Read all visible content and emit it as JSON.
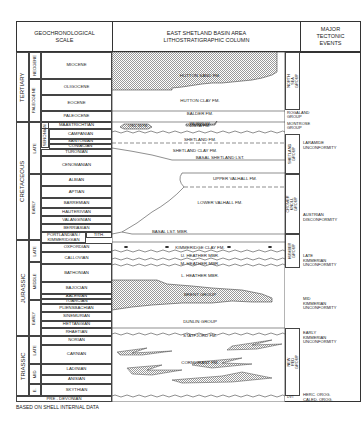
{
  "header": {
    "left": "GEOCHRONOLOGICAL\nSCALE",
    "center": "EAST SHETLAND BASIN AREA\nLITHOSTRATIGRAPHIC COLUMN",
    "right": "MAJOR\nTECTONIC\nEVENTS"
  },
  "eras": [
    {
      "name": "TERTIARY",
      "subs": [
        "NEOGENE",
        "PALEOGENE"
      ]
    },
    {
      "name": "CRETACEOUS",
      "subs": [
        "LATE",
        "EARLY",
        "SENONIAN"
      ]
    },
    {
      "name": "JURASSIC",
      "subs": [
        "LATE",
        "MIDDLE",
        "EARLY"
      ]
    },
    {
      "name": "TRIASSIC",
      "subs": [
        "LATE",
        "MID",
        "E."
      ]
    }
  ],
  "stages": [
    "MIOCENE",
    "OLIGOCENE",
    "EOCENE",
    "PALEOCENE",
    "MAASTRICHTIAN",
    "CAMPANIAN",
    "SANTONIAN",
    "CONIACIAN",
    "TURONIAN",
    "CENOMANIAN",
    "ALBIAN",
    "APTIAN",
    "BARREMIAN",
    "HAUTERIVIAN",
    "VALANGINIAN",
    "BERRIASIAN",
    "PORTLANDIAN /\nKIMMERIDGIAN",
    "TITH.",
    "OXFORDIAN",
    "CALLOVIAN",
    "BATHONIAN",
    "BAJOCIAN",
    "AALENIAN",
    "TOARCIAN",
    "PLIENSBACHIAN",
    "SINEMURIAN",
    "HETTANGIAN",
    "RHAETIAN",
    "NORIAN",
    "CARNIAN",
    "LADINIAN",
    "ANISIAN",
    "SKYTHIAN",
    "PRE - DEVONIAN"
  ],
  "formations": {
    "hutton_sand": "HUTTON SAND FM.",
    "hutton_clay": "HUTTON CLAY FM.",
    "balder": "BALDER FM.",
    "lista": "LISTA FM.",
    "lyell": "LYELL SS FM.",
    "maureen": "MAUREEN FM.",
    "shetland": "SHETLAND FM.",
    "shetland_clay": "SHETLAND CLAY FM.",
    "basal_shetland": "BASAL SHETLAND LST.",
    "upper_valhall": "UPPER VALHALL FM.",
    "lower_valhall": "LOWER VALHALL FM.",
    "basal_lst": "BASAL LST. MBR.",
    "kimmeridge": "KIMMERIDGE CLAY FM.",
    "u_heather": "U. HEATHER MBR.",
    "m_heather": "M. HEATHER MBR.",
    "l_heather": "L. HEATHER MBR.",
    "brent": "BRENT GROUP",
    "dunlin": "DUNLIN GROUP",
    "statfjord": "STATFJORD FM.",
    "cormorant": "CORMORANT FM."
  },
  "groups": {
    "north_sea": "NORTH SEA\nGROUP",
    "rogaland": "ROGALAND\nGROUP",
    "montrose": "MONTROSE\nGROUP",
    "shetland": "SHETLAND\nGROUP",
    "cromer": "CROMER\nKNOLL GROUP",
    "humber": "HUMBER\nGROUP",
    "new_red": "NEW RED GROUP",
    "dvt": "DVT"
  },
  "events": [
    "LARAMIDE\nUNCONFORMITY",
    "AUSTRIAN\nDISCONFORMITY",
    "LATE\nKIMMERIAN\nUNCONFORMITY",
    "MID\nKIMMERIAN\nUNCONFORMITY",
    "EARLY\nKIMMERIAN\nUNCONFORMITY",
    "HERC. OROG.\nCALED. OROG."
  ],
  "footer": "BASED ON SHELL INTERNAL DATA",
  "colors": {
    "line": "#444444",
    "hatch": "#bdbdbd",
    "background": "#ffffff"
  }
}
